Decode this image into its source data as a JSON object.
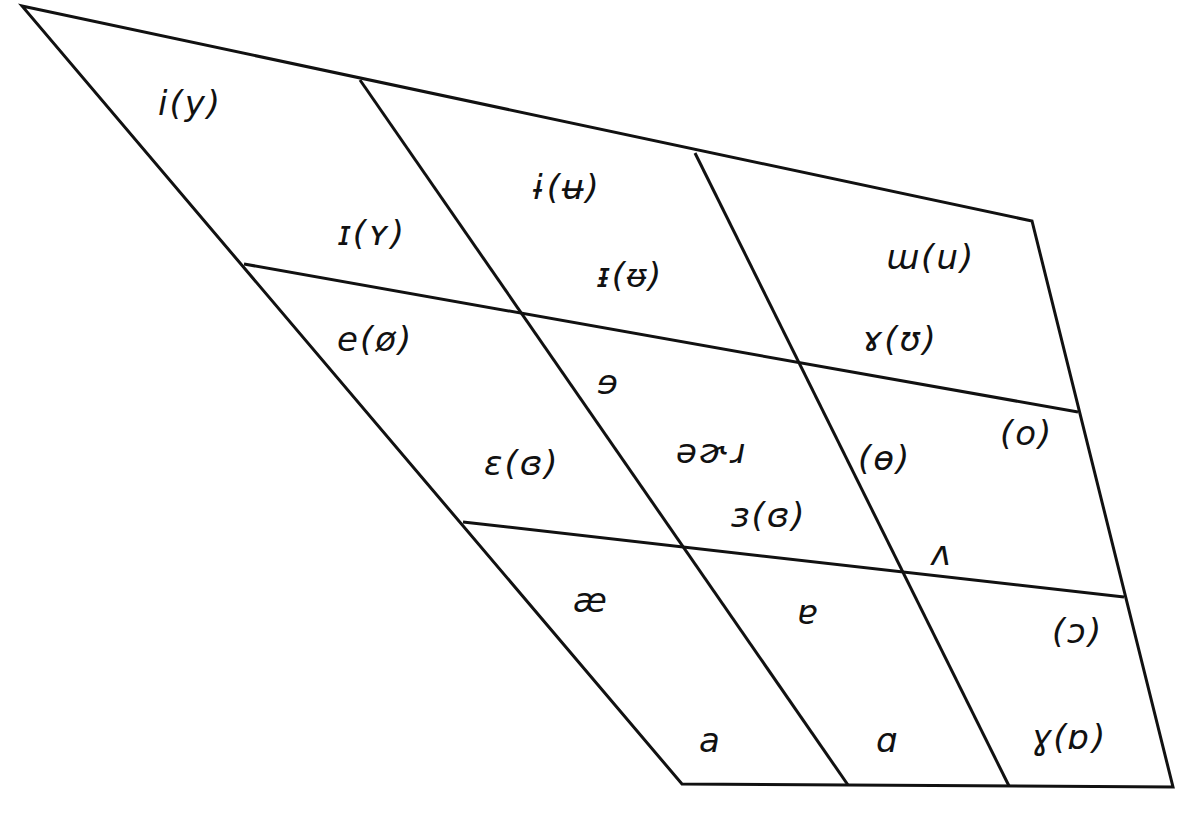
{
  "diagram": {
    "type": "vowel-quadrilateral",
    "line_color": "#111111",
    "background": "#ffffff",
    "outline": [
      [
        22,
        6
      ],
      [
        1032,
        221
      ],
      [
        1173,
        787
      ],
      [
        682,
        784
      ]
    ],
    "grid_lines": [
      {
        "name": "front-central-divider",
        "from": [
          360,
          80
        ],
        "to": [
          848,
          785
        ]
      },
      {
        "name": "central-back-divider",
        "from": [
          695,
          153
        ],
        "to": [
          1009,
          786
        ]
      },
      {
        "name": "close-mid-divider",
        "from": [
          244,
          264
        ],
        "to": [
          1078,
          412
        ]
      },
      {
        "name": "mid-open-divider",
        "from": [
          463,
          522
        ],
        "to": [
          1124,
          597
        ]
      }
    ],
    "labels": [
      {
        "id": "close-front",
        "text": "i(y)",
        "x": 158,
        "y": 86
      },
      {
        "id": "near-close-front",
        "text": "ɪ(ʏ)",
        "x": 338,
        "y": 216
      },
      {
        "id": "close-central",
        "text": "ɨ(ʉ)",
        "x": 532,
        "y": 170
      },
      {
        "id": "near-close-central",
        "text": "ᵻ(ᵿ)",
        "x": 597,
        "y": 258
      },
      {
        "id": "close-back",
        "text": "ɯ(u)",
        "x": 886,
        "y": 240
      },
      {
        "id": "near-close-back",
        "text": "ɤ(ʊ)",
        "x": 862,
        "y": 322
      },
      {
        "id": "close-mid-front",
        "text": "e(ø)",
        "x": 337,
        "y": 322
      },
      {
        "id": "close-mid-central",
        "text": "ɘ",
        "x": 597,
        "y": 365
      },
      {
        "id": "mid-central",
        "text": "əɚɹ",
        "x": 676,
        "y": 434
      },
      {
        "id": "open-mid-front",
        "text": "ɛ(ɞ)",
        "x": 484,
        "y": 446
      },
      {
        "id": "open-mid-central",
        "text": "ɜ(ɞ)",
        "x": 731,
        "y": 498
      },
      {
        "id": "close-mid-back",
        "text": "(ɵ)",
        "x": 858,
        "y": 441
      },
      {
        "id": "mid-back",
        "text": "(o)",
        "x": 1000,
        "y": 416
      },
      {
        "id": "open-mid-back",
        "text": "ʌ",
        "x": 931,
        "y": 536
      },
      {
        "id": "near-open-front",
        "text": "æ",
        "x": 573,
        "y": 583
      },
      {
        "id": "near-open-central",
        "text": "ɐ",
        "x": 797,
        "y": 595
      },
      {
        "id": "open-back-rounded",
        "text": "(ɔ)",
        "x": 1052,
        "y": 614
      },
      {
        "id": "open-front",
        "text": "a",
        "x": 699,
        "y": 723
      },
      {
        "id": "open-central",
        "text": "ɑ",
        "x": 876,
        "y": 723
      },
      {
        "id": "open-back",
        "text": "ɣ(ɒ)",
        "x": 1031,
        "y": 720
      }
    ]
  }
}
